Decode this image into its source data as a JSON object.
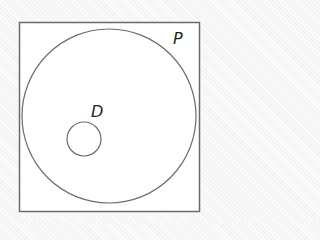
{
  "diagram": {
    "type": "venn",
    "universe": {
      "x": 19,
      "y": 22,
      "width": 180,
      "height": 189,
      "stroke": "#6b6b6b",
      "fill": "#ffffff"
    },
    "sets": [
      {
        "label": "P",
        "cx": 109,
        "cy": 116,
        "r": 87,
        "label_x": 173,
        "label_y": 44
      },
      {
        "label": "D",
        "cx": 84,
        "cy": 139,
        "r": 17,
        "label_x": 91,
        "label_y": 117
      }
    ],
    "colors": {
      "stroke": "#6b6b6b",
      "text": "#222222"
    }
  }
}
